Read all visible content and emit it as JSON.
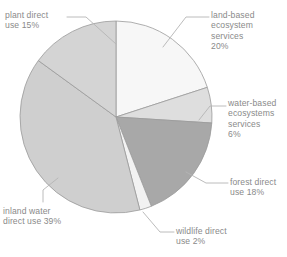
{
  "chart_data": {
    "type": "pie",
    "title": "",
    "subtitle": "",
    "xlabel": "",
    "ylabel": "",
    "legend_position": "none",
    "grid": false,
    "labels_placement": "outside-with-leader-lines",
    "start_angle_deg": 0,
    "direction": "clockwise",
    "unit": "%",
    "categories": [
      "land-based ecosystem services",
      "water-based ecosystems services",
      "forest direct use",
      "wildlife direct use",
      "inland water direct use",
      "plant direct use"
    ],
    "values": [
      20,
      6,
      18,
      2,
      39,
      15
    ],
    "colors": [
      "#f7f7f7",
      "#dedede",
      "#a8a8a8",
      "#f2f2f2",
      "#cfcfcf",
      "#d4d4d4"
    ],
    "slices": [
      {
        "name": "land-based ecosystem services",
        "value": 20,
        "value_text": "20%",
        "label_lines": "land-based\necosystem\nservices\n20%",
        "color": "#f7f7f7",
        "start_deg": 0,
        "end_deg": 72
      },
      {
        "name": "water-based ecosystems services",
        "value": 6,
        "value_text": "6%",
        "label_lines": "water-based\necosystems\nservices\n6%",
        "color": "#dedede",
        "start_deg": 72,
        "end_deg": 93.6
      },
      {
        "name": "forest direct use",
        "value": 18,
        "value_text": "18%",
        "label_lines": "forest direct\nuse  18%",
        "color": "#a8a8a8",
        "start_deg": 93.6,
        "end_deg": 158.4
      },
      {
        "name": "wildlife direct use",
        "value": 2,
        "value_text": "2%",
        "label_lines": "wildlife direct\nuse  2%",
        "color": "#f2f2f2",
        "start_deg": 158.4,
        "end_deg": 165.6
      },
      {
        "name": "inland water direct use",
        "value": 39,
        "value_text": "39%",
        "label_lines": "inland water\ndirect use  39%",
        "color": "#cfcfcf",
        "start_deg": 165.6,
        "end_deg": 306
      },
      {
        "name": "plant direct use",
        "value": 15,
        "value_text": "15%",
        "label_lines": "plant direct\nuse  15%",
        "color": "#d4d4d4",
        "start_deg": 306,
        "end_deg": 360
      }
    ]
  },
  "style": {
    "text_color": "#8a8a8a",
    "leader_line_color": "#b4b4b4",
    "slice_border_color": "#9a9a9a",
    "background": "#ffffff"
  }
}
